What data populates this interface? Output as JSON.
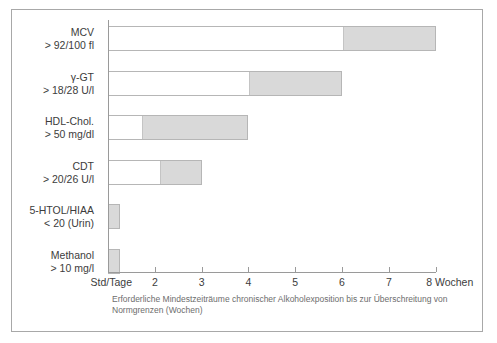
{
  "chart_data": {
    "type": "bar",
    "orientation": "horizontal",
    "title": "",
    "caption": "Erforderliche Mindestzeiträume chronischer Alkoholexposition bis zur Überschreitung von Normgrenzen (Wochen)",
    "xlabel": "",
    "ylabel": "",
    "xlim": [
      1,
      8
    ],
    "grid": false,
    "axis_unit_label": "8 Wochen",
    "tick_labels": [
      "Std/Tage",
      "2",
      "3",
      "4",
      "5",
      "6",
      "7",
      "8 Wochen"
    ],
    "tick_values": [
      1,
      2,
      3,
      4,
      5,
      6,
      7,
      8
    ],
    "categories": [
      {
        "name": "MCV",
        "threshold": "> 92/100 fl",
        "start": 6.0,
        "end": 8.0
      },
      {
        "name": "γ-GT",
        "threshold": "> 18/28 U/l",
        "start": 4.0,
        "end": 6.0
      },
      {
        "name": "HDL-Chol.",
        "threshold": "> 50 mg/dl",
        "start": 1.7,
        "end": 4.0
      },
      {
        "name": "CDT",
        "threshold": "> 20/26 U/l",
        "start": 2.1,
        "end": 3.0
      },
      {
        "name": "5-HTOL/HIAA",
        "threshold": "< 20 (Urin)",
        "start": 1.0,
        "end": 1.25
      },
      {
        "name": "Methanol",
        "threshold": "> 10 mg/l",
        "start": 1.0,
        "end": 1.25
      }
    ],
    "colors": {
      "bar_fill": "#d9d9d9",
      "bar_border": "#b6b6b6",
      "bar_empty": "#ffffff",
      "axis": "#9a9a9a",
      "text": "#3c3c3c",
      "caption_text": "#6d6d6d",
      "frame": "#a8a8a8",
      "background": "#ffffff"
    }
  }
}
